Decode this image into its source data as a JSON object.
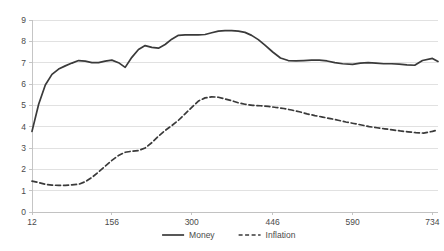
{
  "chart_data": {
    "type": "line",
    "title": "",
    "subtitle": "",
    "xlabel": "",
    "ylabel": "",
    "xlim": [
      12,
      744
    ],
    "ylim": [
      0,
      9
    ],
    "grid": "horizontal",
    "legend_position": "bottom-center",
    "y_ticks": [
      "0",
      "1",
      "2",
      "3",
      "4",
      "5",
      "6",
      "7",
      "8",
      "9"
    ],
    "y_tick_values": [
      0,
      1,
      2,
      3,
      4,
      5,
      6,
      7,
      8,
      9
    ],
    "x_ticks": [
      "12",
      "156",
      "300",
      "446",
      "590",
      "734"
    ],
    "x_tick_values": [
      12,
      156,
      300,
      446,
      590,
      734
    ],
    "series": [
      {
        "name": "Money",
        "style": "solid",
        "color": "#3a3a3a",
        "x": [
          12,
          24,
          36,
          48,
          60,
          72,
          84,
          96,
          108,
          120,
          132,
          144,
          156,
          168,
          180,
          192,
          204,
          216,
          228,
          240,
          252,
          264,
          276,
          288,
          300,
          312,
          324,
          336,
          348,
          360,
          372,
          384,
          396,
          408,
          420,
          432,
          446,
          460,
          474,
          488,
          502,
          516,
          530,
          544,
          558,
          572,
          590,
          604,
          618,
          632,
          646,
          660,
          674,
          688,
          702,
          716,
          734,
          744
        ],
        "values": [
          3.78,
          5.05,
          5.95,
          6.45,
          6.7,
          6.85,
          6.98,
          7.1,
          7.07,
          7.0,
          7.0,
          7.07,
          7.12,
          7.0,
          6.78,
          7.25,
          7.62,
          7.8,
          7.72,
          7.68,
          7.85,
          8.1,
          8.28,
          8.3,
          8.3,
          8.3,
          8.32,
          8.4,
          8.48,
          8.5,
          8.5,
          8.48,
          8.42,
          8.28,
          8.08,
          7.82,
          7.5,
          7.22,
          7.1,
          7.08,
          7.1,
          7.12,
          7.12,
          7.08,
          7.0,
          6.95,
          6.92,
          6.98,
          7.0,
          6.98,
          6.95,
          6.95,
          6.93,
          6.9,
          6.88,
          7.1,
          7.2,
          7.05
        ]
      },
      {
        "name": "Inflation",
        "style": "dashed",
        "color": "#3a3a3a",
        "x": [
          12,
          24,
          36,
          48,
          60,
          72,
          84,
          96,
          108,
          120,
          132,
          144,
          156,
          168,
          180,
          192,
          204,
          216,
          228,
          240,
          252,
          264,
          276,
          288,
          300,
          312,
          324,
          336,
          348,
          360,
          372,
          384,
          396,
          410,
          424,
          438,
          452,
          466,
          480,
          494,
          508,
          522,
          536,
          550,
          564,
          578,
          592,
          606,
          620,
          634,
          648,
          662,
          676,
          690,
          704,
          718,
          734,
          744
        ],
        "values": [
          1.45,
          1.38,
          1.3,
          1.26,
          1.25,
          1.25,
          1.27,
          1.3,
          1.42,
          1.62,
          1.88,
          2.15,
          2.42,
          2.65,
          2.8,
          2.85,
          2.88,
          3.0,
          3.25,
          3.55,
          3.82,
          4.05,
          4.3,
          4.6,
          4.9,
          5.2,
          5.35,
          5.4,
          5.38,
          5.3,
          5.22,
          5.12,
          5.05,
          5.0,
          4.98,
          4.95,
          4.9,
          4.85,
          4.78,
          4.7,
          4.6,
          4.52,
          4.45,
          4.38,
          4.3,
          4.22,
          4.15,
          4.08,
          4.0,
          3.95,
          3.9,
          3.85,
          3.8,
          3.76,
          3.72,
          3.7,
          3.78,
          3.85
        ]
      }
    ],
    "legend": [
      {
        "label": "Money",
        "style": "solid"
      },
      {
        "label": "Inflation",
        "style": "dashed"
      }
    ]
  }
}
